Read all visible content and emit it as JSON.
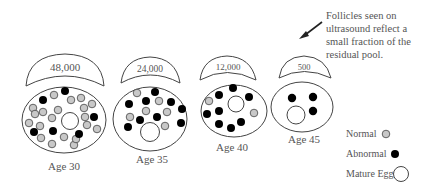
{
  "annotation": {
    "lines": [
      "Follicles seen on",
      "ultrasound reflect a",
      "small fraction of the",
      "residual pool."
    ]
  },
  "groups": [
    {
      "age_label": "Age 30",
      "count": "48,000",
      "normal": 20,
      "abnormal": 7,
      "mature": 1
    },
    {
      "age_label": "Age 35",
      "count": "24,000",
      "normal": 7,
      "abnormal": 10,
      "mature": 1
    },
    {
      "age_label": "Age 40",
      "count": "12,000",
      "normal": 2,
      "abnormal": 9,
      "mature": 1
    },
    {
      "age_label": "Age 45",
      "count": "500",
      "normal": 0,
      "abnormal": 3,
      "mature": 1
    }
  ],
  "legend": {
    "normal": "Normal",
    "abnormal": "Abnormal",
    "mature": "Mature Egg"
  },
  "colors": {
    "normal_fill": "#c8c8c8",
    "abnormal_fill": "#000000",
    "outline": "#444444",
    "text": "#555555"
  }
}
